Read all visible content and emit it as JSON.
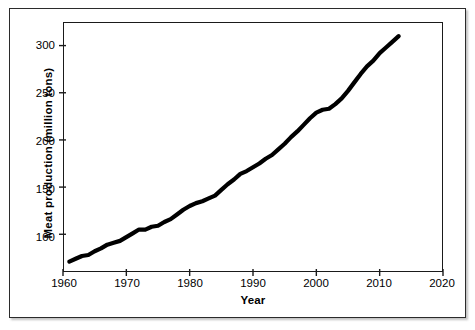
{
  "chart_data": {
    "type": "line",
    "title": "",
    "xlabel": "Year",
    "ylabel": "Meat production (million tons)",
    "xlim": [
      1960,
      2020
    ],
    "ylim": [
      60,
      325
    ],
    "xticks": [
      1960,
      1970,
      1980,
      1990,
      2000,
      2010,
      2020
    ],
    "xticklabels": [
      "1960",
      "1970",
      "1980",
      "1990",
      "2000",
      "2010",
      "2020"
    ],
    "yticks": [
      100,
      150,
      200,
      250,
      300
    ],
    "yticklabels": [
      "100",
      "150",
      "200",
      "250",
      "300"
    ],
    "grid": false,
    "legend": false,
    "legend_position": "none",
    "series": [
      {
        "name": "World meat production",
        "color": "#000000",
        "line_width": 4.2,
        "x": [
          1961,
          1962,
          1963,
          1964,
          1965,
          1966,
          1967,
          1968,
          1969,
          1970,
          1971,
          1972,
          1973,
          1974,
          1975,
          1976,
          1977,
          1978,
          1979,
          1980,
          1981,
          1982,
          1983,
          1984,
          1985,
          1986,
          1987,
          1988,
          1989,
          1990,
          1991,
          1992,
          1993,
          1994,
          1995,
          1996,
          1997,
          1998,
          1999,
          2000,
          2001,
          2002,
          2003,
          2004,
          2005,
          2006,
          2007,
          2008,
          2009,
          2010,
          2011,
          2012,
          2013
        ],
        "y": [
          71,
          74,
          77,
          78,
          82,
          85,
          89,
          91,
          93,
          97,
          101,
          105,
          105,
          108,
          109,
          113,
          116,
          121,
          126,
          130,
          133,
          135,
          138,
          141,
          147,
          153,
          158,
          164,
          167,
          171,
          175,
          180,
          184,
          190,
          196,
          203,
          209,
          216,
          223,
          229,
          232,
          233,
          238,
          244,
          252,
          261,
          270,
          278,
          284,
          292,
          298,
          304,
          310
        ],
        "units": "million tons"
      }
    ],
    "annotations": []
  },
  "axes": {
    "x_title": "Year",
    "y_title": "Meat production (million tons)"
  }
}
